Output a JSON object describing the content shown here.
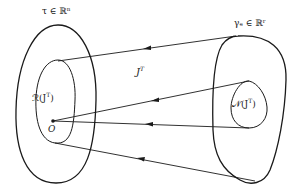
{
  "diagram": {
    "type": "set-mapping",
    "domain_set": {
      "label": "τ ∈ ℝⁿ",
      "symbol": "τ",
      "space": "ℝ",
      "dimension": "n"
    },
    "codomain_set": {
      "label": "γₑ ∈ ℝʳ",
      "symbol": "γₑ",
      "space": "ℝ",
      "dimension": "r"
    },
    "mapping": {
      "label": "Jᵀ",
      "base": "J",
      "superscript": "T"
    },
    "range_subset": {
      "label": "ℛ(Jᵀ)",
      "prefix": "ℛ(J",
      "superscript": "T",
      "suffix": ")"
    },
    "null_subset": {
      "label": "𝒩(Jᵀ)",
      "prefix": "𝒩(J",
      "superscript": "T",
      "suffix": ")"
    },
    "origin": {
      "label": "O"
    },
    "arrows": [
      {
        "from": "codomain outer boundary (top)",
        "to": "range boundary (top)",
        "direction": "right-to-left"
      },
      {
        "from": "null space boundary (top)",
        "to": "origin O",
        "direction": "right-to-left"
      },
      {
        "from": "null space boundary (bottom)",
        "to": "origin O",
        "direction": "right-to-left"
      },
      {
        "from": "codomain outer boundary (bottom)",
        "to": "range boundary (bottom)",
        "direction": "right-to-left"
      }
    ],
    "colors": {
      "stroke": "#1a1a1a",
      "background": "#ffffff"
    }
  }
}
